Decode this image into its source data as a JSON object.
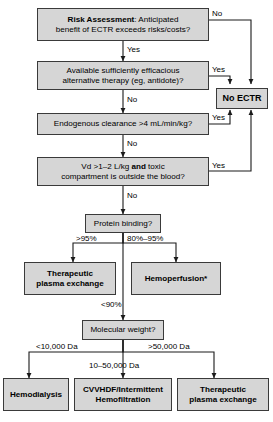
{
  "diagram": {
    "box_fill": "#d6d6d6",
    "box_stroke": "#3a3a3a",
    "line_color": "#1a1a1a",
    "nodes": {
      "risk_assessment": {
        "label_bold": "Risk Assessment",
        "label_rest": ": Anticipated",
        "line2": "benefit of ECTR exceeds risks/costs?"
      },
      "alternative_therapy": {
        "line1": "Available sufficiently efficacious",
        "line2": "alternative therapy (eg, antidote)?"
      },
      "endogenous_clearance": {
        "line1": "Endogenous clearance >4 mL/min/kg?"
      },
      "vd_compartment": {
        "line1_a": "Vd >1–2 L/kg ",
        "line1_b": "and",
        "line1_c": " toxic",
        "line2": "compartment is outside the blood?"
      },
      "no_ectr": {
        "label": "No ECTR"
      },
      "protein_binding": {
        "label": "Protein binding?"
      },
      "tpe_upper": {
        "line1": "Therapeutic",
        "line2": "plasma exchange"
      },
      "hemoperfusion": {
        "label": "Hemoperfusion*"
      },
      "molecular_weight": {
        "label": "Molecular weight?"
      },
      "hemodialysis": {
        "label": "Hemodialysis"
      },
      "cvvhdf": {
        "line1": "CVVHDF/Intermittent",
        "line2": "Hemofiltration"
      },
      "tpe_lower": {
        "line1": "Therapeutic",
        "line2": "plasma exchange"
      }
    },
    "edge_labels": {
      "risk_no": "No",
      "risk_yes": "Yes",
      "alt_yes": "Yes",
      "alt_no": "No",
      "clearance_yes": "Yes",
      "clearance_no": "No",
      "vd_yes": "Yes",
      "vd_no": "No",
      "pb_over95": ">95%",
      "pb_80_95": "80%–95%",
      "pb_under90": "<90%",
      "mw_under10k": "<10,000 Da",
      "mw_10_50k": "10–50,000 Da",
      "mw_over50k": ">50,000 Da"
    }
  }
}
